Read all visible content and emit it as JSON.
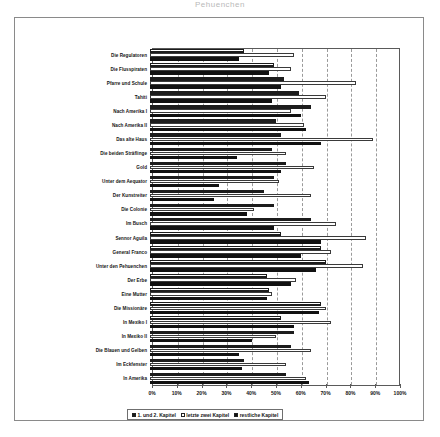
{
  "cropped_heading": "Pehuenchen",
  "legend": {
    "position": "bottom",
    "items": [
      {
        "label": "1. und 2. Kapitel",
        "key": "hatched"
      },
      {
        "label": "letzte zwei Kapitel",
        "key": "white"
      },
      {
        "label": "restliche Kapitel",
        "key": "black"
      }
    ]
  },
  "chart_data": {
    "type": "bar",
    "orientation": "horizontal",
    "title": "",
    "xlabel": "",
    "ylabel": "",
    "xlim": [
      0,
      100
    ],
    "xticks": [
      "0%",
      "10%",
      "20%",
      "30%",
      "40%",
      "50%",
      "60%",
      "70%",
      "80%",
      "90%",
      "100%"
    ],
    "xtick_values": [
      0,
      10,
      20,
      30,
      40,
      50,
      60,
      70,
      80,
      90,
      100
    ],
    "grid": true,
    "categories": [
      "Die Regulatoren",
      "Die Flusspiraten",
      "Pfarre und Schule",
      "Tahiti",
      "Nach Amerika I",
      "Nach Amerika II",
      "Das alte Haus",
      "Die beiden Sträflinge",
      "Gold",
      "Unter dem Aequator",
      "Der Kunstreiter",
      "Die Colonie",
      "Im Busch",
      "Sennor Aguila",
      "General Franco",
      "Unter den Pehuenchen",
      "Der Erbe",
      "Eine Mutter",
      "Die Missionäre",
      "In Mexiko I",
      "In Mexiko II",
      "Die Blauen und Gelben",
      "Im Eckfenster",
      "In Amerika"
    ],
    "series": [
      {
        "name": "1. und 2. Kapitel",
        "values": [
          38,
          50,
          54,
          60,
          65,
          51,
          53,
          49,
          55,
          50,
          46,
          50,
          65,
          53,
          69,
          71,
          47,
          48,
          69,
          53,
          58,
          57,
          38,
          55
        ]
      },
      {
        "name": "letzte zwei Kapitel",
        "values": [
          58,
          57,
          83,
          71,
          57,
          62,
          90,
          55,
          66,
          52,
          65,
          42,
          75,
          87,
          73,
          86,
          59,
          49,
          71,
          73,
          51,
          65,
          55,
          63
        ]
      },
      {
        "name": "restliche Kapitel",
        "values": [
          36,
          48,
          53,
          49,
          61,
          63,
          69,
          35,
          53,
          28,
          26,
          39,
          50,
          69,
          61,
          67,
          57,
          47,
          68,
          58,
          41,
          36,
          37,
          64
        ]
      }
    ]
  }
}
